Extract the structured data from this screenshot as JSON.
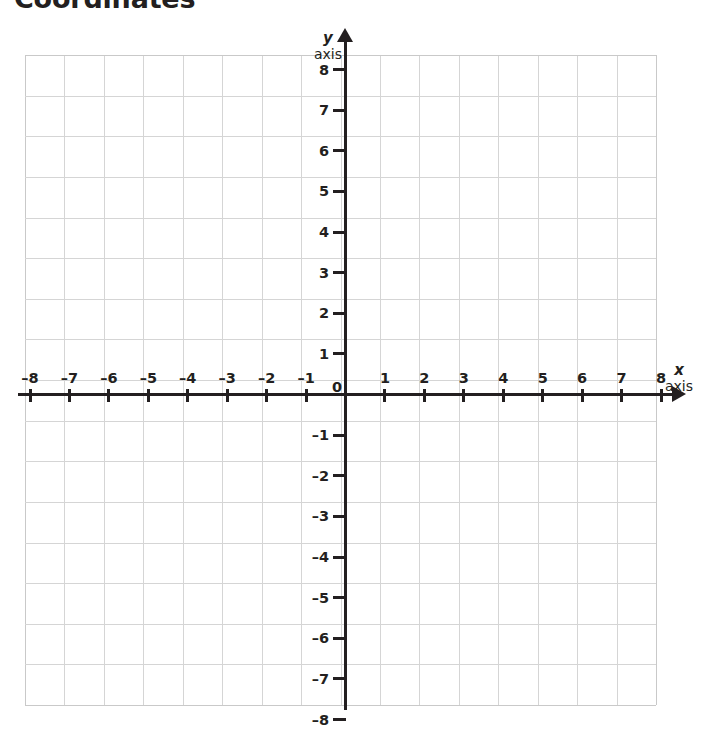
{
  "document": {
    "title": "Coordinates"
  },
  "chart_data": {
    "type": "scatter",
    "title": "Coordinates",
    "xlabel": "x axis",
    "ylabel": "y axis",
    "xlim": [
      -8,
      8
    ],
    "ylim": [
      -8,
      8
    ],
    "grid": true,
    "legend": null,
    "series": [],
    "x_tick_labels": [
      "–8",
      "–7",
      "–6",
      "–5",
      "–4",
      "–3",
      "–2",
      "–1",
      "1",
      "2",
      "3",
      "4",
      "5",
      "6",
      "7",
      "8"
    ],
    "x_tick_values": [
      -8,
      -7,
      -6,
      -5,
      -4,
      -3,
      -2,
      -1,
      1,
      2,
      3,
      4,
      5,
      6,
      7,
      8
    ],
    "y_tick_labels": [
      "8",
      "7",
      "6",
      "5",
      "4",
      "3",
      "2",
      "1",
      "–1",
      "–2",
      "–3",
      "–4",
      "–5",
      "–6",
      "–7",
      "–8"
    ],
    "y_tick_values": [
      8,
      7,
      6,
      5,
      4,
      3,
      2,
      1,
      -1,
      -2,
      -3,
      -4,
      -5,
      -6,
      -7,
      -8
    ],
    "origin_label": "0",
    "grid_color": "#d5d5d5",
    "axis_color": "#231f20"
  },
  "axes": {
    "y": {
      "letter": "y",
      "word": "axis"
    },
    "x": {
      "letter": "x",
      "word": "axis"
    }
  }
}
